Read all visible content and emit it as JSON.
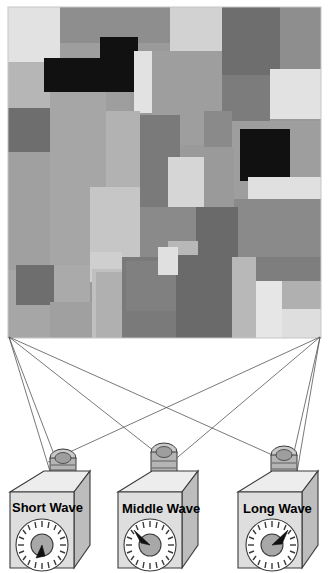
{
  "figure": {
    "panel": {
      "name": "mondrian-pattern",
      "x": 8,
      "y": 7,
      "width": 313,
      "height": 331,
      "background": "#9a9a9a",
      "border": "#c8c8c8"
    },
    "projectors": [
      {
        "id": "short-wave",
        "label": "Short Wave",
        "dial": {
          "pointer_angle_deg": 200,
          "ticks": 20
        },
        "body_x": 10,
        "body_y": 473
      },
      {
        "id": "middle-wave",
        "label": "Middle Wave",
        "dial": {
          "pointer_angle_deg": 315,
          "ticks": 20
        },
        "body_x": 118,
        "body_y": 474
      },
      {
        "id": "long-wave",
        "label": "Long Wave",
        "dial": {
          "pointer_angle_deg": 45,
          "ticks": 20
        },
        "body_x": 238,
        "body_y": 474
      }
    ],
    "beams": {
      "name": "projection-beams",
      "stroke": "#555555",
      "left_corner": {
        "x": 9,
        "y": 337
      },
      "right_corner": {
        "x": 320,
        "y": 337
      }
    },
    "colors": {
      "black": "#111111",
      "dark_gray": "#6e6e6e",
      "mid_gray": "#8e8e8e",
      "gray": "#9e9e9e",
      "light_gray": "#b6b6b6",
      "lighter_gray": "#cfcfcf",
      "near_white": "#e6e6e6",
      "projector_body": "#d8d8d8",
      "projector_top": "#ededed",
      "projector_side": "#bdbdbd",
      "lens": "#b5b5b5",
      "outline": "#3a3a3a"
    },
    "patches": [
      {
        "name": "patch-01",
        "x": 0,
        "y": 0,
        "w": 52,
        "h": 55,
        "c": "#e2e2e2"
      },
      {
        "name": "patch-02",
        "x": 52,
        "y": 0,
        "w": 110,
        "h": 36,
        "c": "#8e8e8e"
      },
      {
        "name": "patch-03",
        "x": 162,
        "y": 0,
        "w": 52,
        "h": 44,
        "c": "#d2d2d2"
      },
      {
        "name": "patch-04",
        "x": 214,
        "y": 0,
        "w": 58,
        "h": 68,
        "c": "#6e6e6e"
      },
      {
        "name": "patch-05",
        "x": 272,
        "y": 0,
        "w": 41,
        "h": 62,
        "c": "#8e8e8e"
      },
      {
        "name": "patch-06",
        "x": 0,
        "y": 55,
        "w": 52,
        "h": 46,
        "c": "#b6b6b6"
      },
      {
        "name": "patch-07",
        "x": 52,
        "y": 36,
        "w": 70,
        "h": 68,
        "c": "#9e9e9e"
      },
      {
        "name": "patch-08",
        "x": 36,
        "y": 51,
        "w": 90,
        "h": 34,
        "c": "#111111"
      },
      {
        "name": "patch-09",
        "x": 92,
        "y": 30,
        "w": 38,
        "h": 55,
        "c": "#111111"
      },
      {
        "name": "patch-10",
        "x": 126,
        "y": 44,
        "w": 18,
        "h": 62,
        "c": "#e2e2e2"
      },
      {
        "name": "patch-11",
        "x": 144,
        "y": 44,
        "w": 70,
        "h": 94,
        "c": "#9e9e9e"
      },
      {
        "name": "patch-12",
        "x": 214,
        "y": 68,
        "w": 48,
        "h": 46,
        "c": "#7c7c7c"
      },
      {
        "name": "patch-13",
        "x": 262,
        "y": 62,
        "w": 51,
        "h": 50,
        "c": "#e2e2e2"
      },
      {
        "name": "patch-14",
        "x": 0,
        "y": 101,
        "w": 42,
        "h": 44,
        "c": "#6e6e6e"
      },
      {
        "name": "patch-15",
        "x": 42,
        "y": 85,
        "w": 56,
        "h": 120,
        "c": "#a6a6a6"
      },
      {
        "name": "patch-16",
        "x": 98,
        "y": 104,
        "w": 34,
        "h": 96,
        "c": "#b2b2b2"
      },
      {
        "name": "patch-17",
        "x": 0,
        "y": 145,
        "w": 42,
        "h": 118,
        "c": "#a0a0a0"
      },
      {
        "name": "patch-18",
        "x": 224,
        "y": 114,
        "w": 89,
        "h": 78,
        "c": "#9e9e9e"
      },
      {
        "name": "patch-19",
        "x": 232,
        "y": 122,
        "w": 50,
        "h": 52,
        "c": "#111111"
      },
      {
        "name": "patch-20",
        "x": 132,
        "y": 108,
        "w": 40,
        "h": 92,
        "c": "#7a7a7a"
      },
      {
        "name": "patch-21",
        "x": 172,
        "y": 138,
        "w": 50,
        "h": 44,
        "c": "#9a9a9a"
      },
      {
        "name": "patch-22",
        "x": 160,
        "y": 150,
        "w": 36,
        "h": 84,
        "c": "#d6d6d6"
      },
      {
        "name": "patch-23",
        "x": 196,
        "y": 140,
        "w": 30,
        "h": 70,
        "c": "#9a9a9a"
      },
      {
        "name": "patch-24",
        "x": 240,
        "y": 170,
        "w": 73,
        "h": 22,
        "c": "#e0e0e0"
      },
      {
        "name": "patch-25",
        "x": 226,
        "y": 192,
        "w": 87,
        "h": 58,
        "c": "#8a8a8a"
      },
      {
        "name": "patch-26",
        "x": 132,
        "y": 200,
        "w": 56,
        "h": 64,
        "c": "#8a8a8a"
      },
      {
        "name": "patch-27",
        "x": 82,
        "y": 180,
        "w": 50,
        "h": 86,
        "c": "#c6c6c6"
      },
      {
        "name": "patch-28",
        "x": 42,
        "y": 205,
        "w": 40,
        "h": 58,
        "c": "#a6a6a6"
      },
      {
        "name": "patch-29",
        "x": 188,
        "y": 200,
        "w": 42,
        "h": 64,
        "c": "#6a6a6a"
      },
      {
        "name": "patch-30",
        "x": 160,
        "y": 234,
        "w": 30,
        "h": 30,
        "c": "#b8b8b8"
      },
      {
        "name": "patch-31",
        "x": 0,
        "y": 263,
        "w": 42,
        "h": 74,
        "c": "#a6a6a6"
      },
      {
        "name": "patch-32",
        "x": 8,
        "y": 258,
        "w": 38,
        "h": 40,
        "c": "#6e6e6e"
      },
      {
        "name": "patch-33",
        "x": 46,
        "y": 258,
        "w": 36,
        "h": 42,
        "c": "#aaaaaa"
      },
      {
        "name": "patch-34",
        "x": 42,
        "y": 295,
        "w": 46,
        "h": 42,
        "c": "#a0a0a0"
      },
      {
        "name": "patch-35",
        "x": 82,
        "y": 245,
        "w": 32,
        "h": 30,
        "c": "#cfcfcf"
      },
      {
        "name": "patch-36",
        "x": 84,
        "y": 262,
        "w": 30,
        "h": 75,
        "c": "#c0c0c0"
      },
      {
        "name": "patch-37",
        "x": 88,
        "y": 265,
        "w": 28,
        "h": 72,
        "c": "#b0b0b0"
      },
      {
        "name": "patch-38",
        "x": 114,
        "y": 250,
        "w": 58,
        "h": 87,
        "c": "#7a7a7a"
      },
      {
        "name": "patch-39",
        "x": 118,
        "y": 254,
        "w": 52,
        "h": 50,
        "c": "#808080"
      },
      {
        "name": "patch-40",
        "x": 168,
        "y": 248,
        "w": 56,
        "h": 89,
        "c": "#6a6a6a"
      },
      {
        "name": "patch-41",
        "x": 224,
        "y": 250,
        "w": 24,
        "h": 87,
        "c": "#b8b8b8"
      },
      {
        "name": "patch-42",
        "x": 248,
        "y": 250,
        "w": 65,
        "h": 24,
        "c": "#7e7e7e"
      },
      {
        "name": "patch-43",
        "x": 248,
        "y": 274,
        "w": 26,
        "h": 63,
        "c": "#e6e6e6"
      },
      {
        "name": "patch-44",
        "x": 274,
        "y": 274,
        "w": 39,
        "h": 28,
        "c": "#b0b0b0"
      },
      {
        "name": "patch-45",
        "x": 274,
        "y": 302,
        "w": 39,
        "h": 35,
        "c": "#dedede"
      },
      {
        "name": "patch-46",
        "x": 150,
        "y": 240,
        "w": 20,
        "h": 28,
        "c": "#e0e0e0"
      },
      {
        "name": "patch-47",
        "x": 196,
        "y": 104,
        "w": 28,
        "h": 36,
        "c": "#8a8a8a"
      }
    ]
  }
}
